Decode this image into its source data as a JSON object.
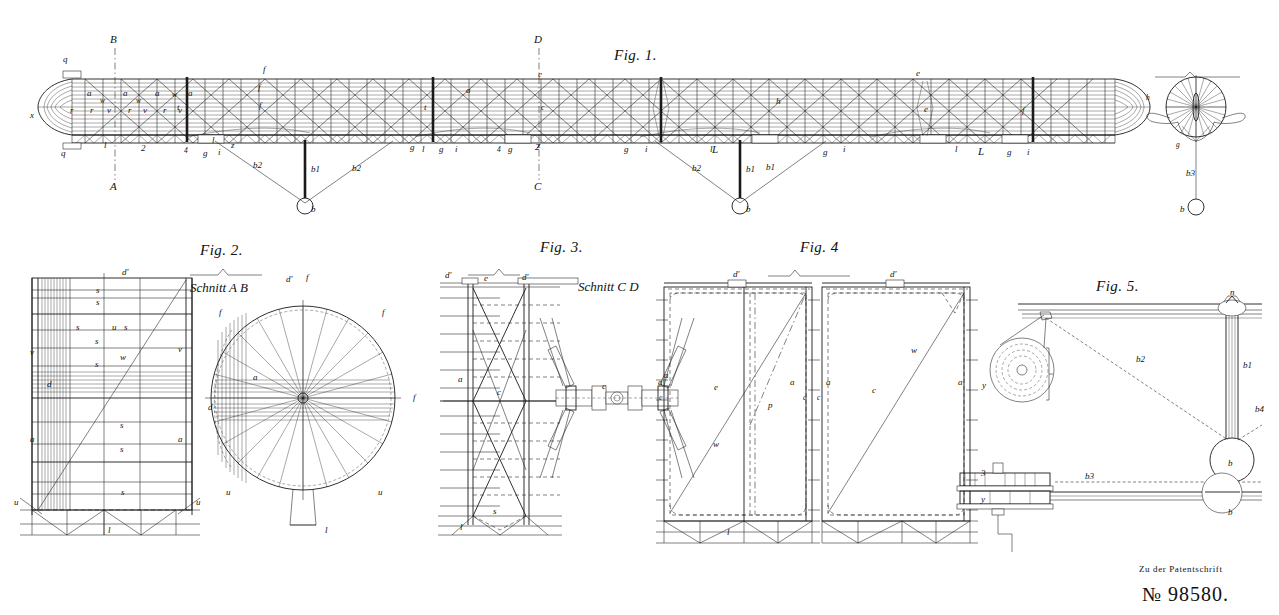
{
  "sheet": {
    "title": "Patent drawing sheet",
    "background_color": "#ffffff",
    "ink_color": "#1a1a1a"
  },
  "footer": {
    "caption": "Zu der Patentschrift",
    "patent_number": "№ 98580."
  },
  "figures": [
    {
      "id": "fig1",
      "label": "Fig. 1.",
      "description": "Longitudinal elevation of rigid airship hull with lattice girder, two gondolas and end cross-section",
      "labels": {
        "section_marks": [
          "B",
          "A",
          "D",
          "C"
        ],
        "hull": [
          "x",
          "q",
          "q",
          "a",
          "a",
          "a",
          "a",
          "a",
          "r",
          "r",
          "r",
          "r",
          "v",
          "v",
          "v",
          "w",
          "w",
          "w",
          "t",
          "t",
          "e",
          "e",
          "e",
          "h",
          "f",
          "f",
          "f",
          "f",
          "z",
          "z",
          "l",
          "l",
          "l",
          "l",
          "l",
          "g",
          "g",
          "g",
          "g",
          "g",
          "g",
          "g",
          "i",
          "i",
          "i",
          "i",
          "i",
          "L",
          "L",
          "2",
          "2",
          "4",
          "4",
          "c"
        ],
        "suspension": [
          "b",
          "b",
          "b",
          "b1",
          "b1",
          "b1",
          "b2",
          "b2",
          "b2",
          "b3"
        ]
      }
    },
    {
      "id": "fig2",
      "label": "Fig. 2.",
      "section_label": "Schnitt A B",
      "description": "Transverse frame elevation and circular cross-section with radial spokes",
      "labels": [
        "d'",
        "d'",
        "s",
        "s",
        "s",
        "s",
        "s",
        "s",
        "s",
        "s",
        "s",
        "u",
        "u",
        "u",
        "u",
        "u",
        "w",
        "v",
        "v",
        "a",
        "a",
        "a",
        "d",
        "d",
        "l",
        "l",
        "f",
        "f",
        "f",
        "f"
      ]
    },
    {
      "id": "fig3",
      "label": "Fig. 3.",
      "section_label": "Schnitt C D",
      "description": "Frame bay cross bracing and propeller drive shaft detail",
      "labels": [
        "d'",
        "d'",
        "e",
        "a",
        "a",
        "c",
        "c",
        "s",
        "l"
      ]
    },
    {
      "id": "fig4",
      "label": "Fig. 4",
      "description": "Two gas cell compartments between transverse frames",
      "labels": [
        "d'",
        "d'",
        "a",
        "a",
        "a",
        "a",
        "c",
        "c",
        "c",
        "e",
        "p",
        "w",
        "w",
        "l"
      ]
    },
    {
      "id": "fig5",
      "label": "Fig. 5.",
      "description": "Gondola suspension winch with pulley and engine detail",
      "labels": [
        "n",
        "y",
        "y",
        "3",
        "b",
        "b",
        "b1",
        "b2",
        "b3",
        "b4"
      ]
    }
  ]
}
